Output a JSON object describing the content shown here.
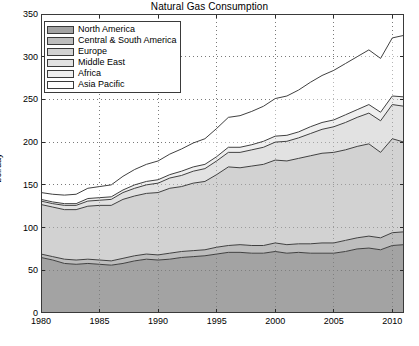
{
  "chart_data": {
    "type": "area",
    "stacked": true,
    "title": "Natural Gas Consumption",
    "xlabel": "",
    "ylabel": "bcf/day",
    "xlim": [
      1980,
      2011
    ],
    "ylim": [
      0,
      350
    ],
    "ytick_labels": [
      "0",
      "50",
      "100",
      "150",
      "200",
      "250",
      "300",
      "350"
    ],
    "yticks": [
      0,
      50,
      100,
      150,
      200,
      250,
      300,
      350
    ],
    "xtick_labels": [
      "1980",
      "1985",
      "1990",
      "1995",
      "2000",
      "2005",
      "2010"
    ],
    "xticks": [
      1980,
      1985,
      1990,
      1995,
      2000,
      2005,
      2010
    ],
    "grid": true,
    "grid_style": "dotted",
    "legend_position": "top-left",
    "x": [
      1980,
      1981,
      1982,
      1983,
      1984,
      1985,
      1986,
      1987,
      1988,
      1989,
      1990,
      1991,
      1992,
      1993,
      1994,
      1995,
      1996,
      1997,
      1998,
      1999,
      2000,
      2001,
      2002,
      2003,
      2004,
      2005,
      2006,
      2007,
      2008,
      2009,
      2010,
      2011
    ],
    "series": [
      {
        "name": "North America",
        "color": "#a3a3a3",
        "values": [
          65,
          62,
          58,
          57,
          58,
          57,
          56,
          58,
          61,
          63,
          62,
          63,
          65,
          66,
          67,
          69,
          71,
          71,
          70,
          70,
          72,
          70,
          71,
          70,
          70,
          70,
          72,
          75,
          76,
          74,
          79,
          80
        ]
      },
      {
        "name": "Central & South America",
        "color": "#bdbdbd",
        "values": [
          4,
          4,
          5,
          5,
          5,
          5,
          5,
          6,
          6,
          6,
          6,
          7,
          7,
          7,
          7,
          8,
          8,
          9,
          9,
          9,
          10,
          10,
          10,
          11,
          12,
          12,
          13,
          13,
          14,
          14,
          15,
          15
        ]
      },
      {
        "name": "Europe",
        "color": "#d2d2d2",
        "values": [
          58,
          58,
          58,
          59,
          62,
          64,
          65,
          69,
          70,
          71,
          73,
          76,
          76,
          79,
          80,
          85,
          92,
          90,
          93,
          95,
          97,
          98,
          100,
          103,
          105,
          106,
          106,
          107,
          108,
          100,
          110,
          105
        ]
      },
      {
        "name": "Middle East",
        "color": "#e2e2e2",
        "values": [
          4,
          4,
          5,
          5,
          6,
          6,
          7,
          8,
          9,
          10,
          11,
          12,
          13,
          14,
          15,
          16,
          17,
          18,
          19,
          20,
          21,
          23,
          24,
          26,
          28,
          30,
          32,
          34,
          36,
          37,
          40,
          42
        ]
      },
      {
        "name": "Africa",
        "color": "#efefef",
        "values": [
          2,
          2,
          2,
          2,
          3,
          3,
          3,
          3,
          4,
          4,
          4,
          4,
          5,
          5,
          5,
          5,
          6,
          6,
          6,
          7,
          7,
          7,
          7,
          8,
          8,
          8,
          9,
          9,
          10,
          10,
          10,
          11
        ]
      },
      {
        "name": "Asia Pacific",
        "color": "#ffffff",
        "values": [
          8,
          9,
          10,
          11,
          12,
          13,
          14,
          16,
          18,
          20,
          22,
          24,
          26,
          28,
          30,
          33,
          35,
          37,
          39,
          41,
          44,
          46,
          49,
          52,
          55,
          58,
          60,
          62,
          64,
          63,
          68,
          72
        ]
      }
    ]
  },
  "legend": {
    "items": [
      {
        "label": "North America"
      },
      {
        "label": "Central & South America"
      },
      {
        "label": "Europe"
      },
      {
        "label": "Middle East"
      },
      {
        "label": "Africa"
      },
      {
        "label": "Asia Pacific"
      }
    ]
  }
}
